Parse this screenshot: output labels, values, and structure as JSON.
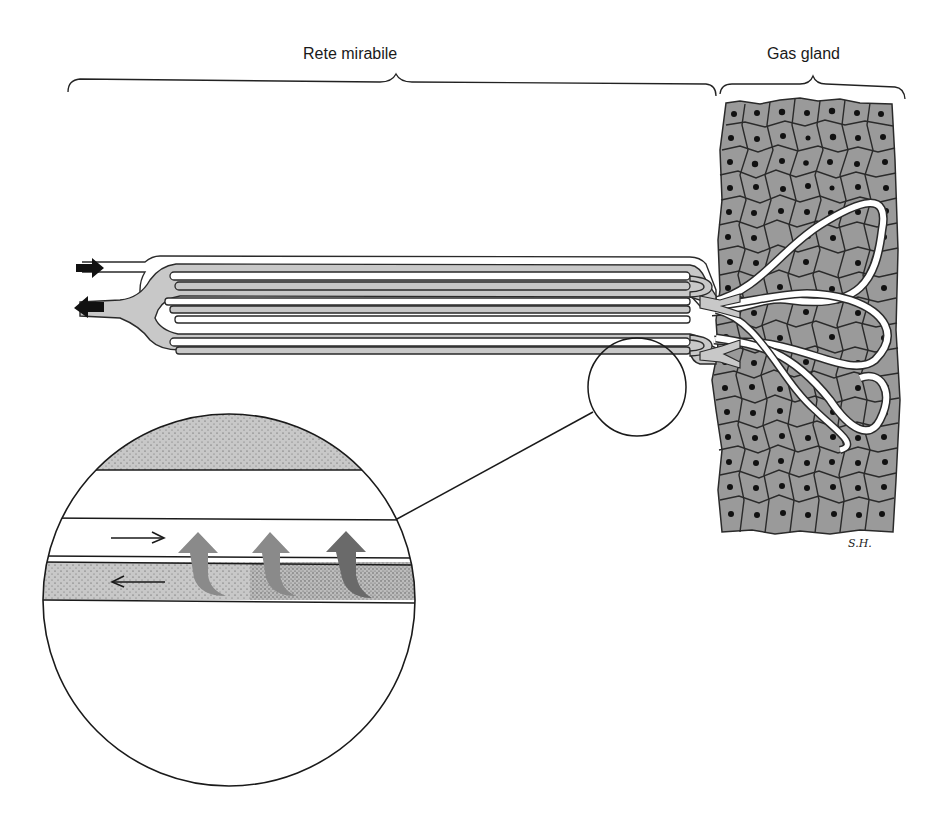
{
  "diagram": {
    "labels": {
      "rete_mirabile": "Rete mirabile",
      "gas_gland": "Gas gland",
      "signature": "S.H."
    },
    "colors": {
      "background": "#ffffff",
      "capillary_fill": "#c8c8c8",
      "gland_cell_fill": "#9a9a9a",
      "outline": "#2a2a2a",
      "nucleus": "#111111",
      "white_vessel": "#ffffff"
    },
    "components": [
      {
        "id": "rete-mirabile",
        "description": "Bundle of parallel counter-current capillaries (arterial inflow and venous outflow)"
      },
      {
        "id": "gas-gland",
        "description": "Block of polygonal gland cells with dark nuclei, penetrated by looping white capillaries"
      },
      {
        "id": "inflow-arrow",
        "description": "Black arrow pointing right into upper vessel"
      },
      {
        "id": "outflow-arrow",
        "description": "Black arrow pointing left out of lower vessel"
      },
      {
        "id": "magnifier-circle-small",
        "description": "Circle marking detail region on capillary bundle"
      },
      {
        "id": "magnifier-circle-large",
        "description": "Enlarged view showing diffusion of gas from outgoing to incoming capillary"
      }
    ],
    "detail_view": {
      "flow_arrows": [
        {
          "direction": "right",
          "channel": "upper white (incoming)"
        },
        {
          "direction": "left",
          "channel": "lower gray stippled (outgoing)"
        }
      ],
      "diffusion_arrows_count": 3
    }
  }
}
